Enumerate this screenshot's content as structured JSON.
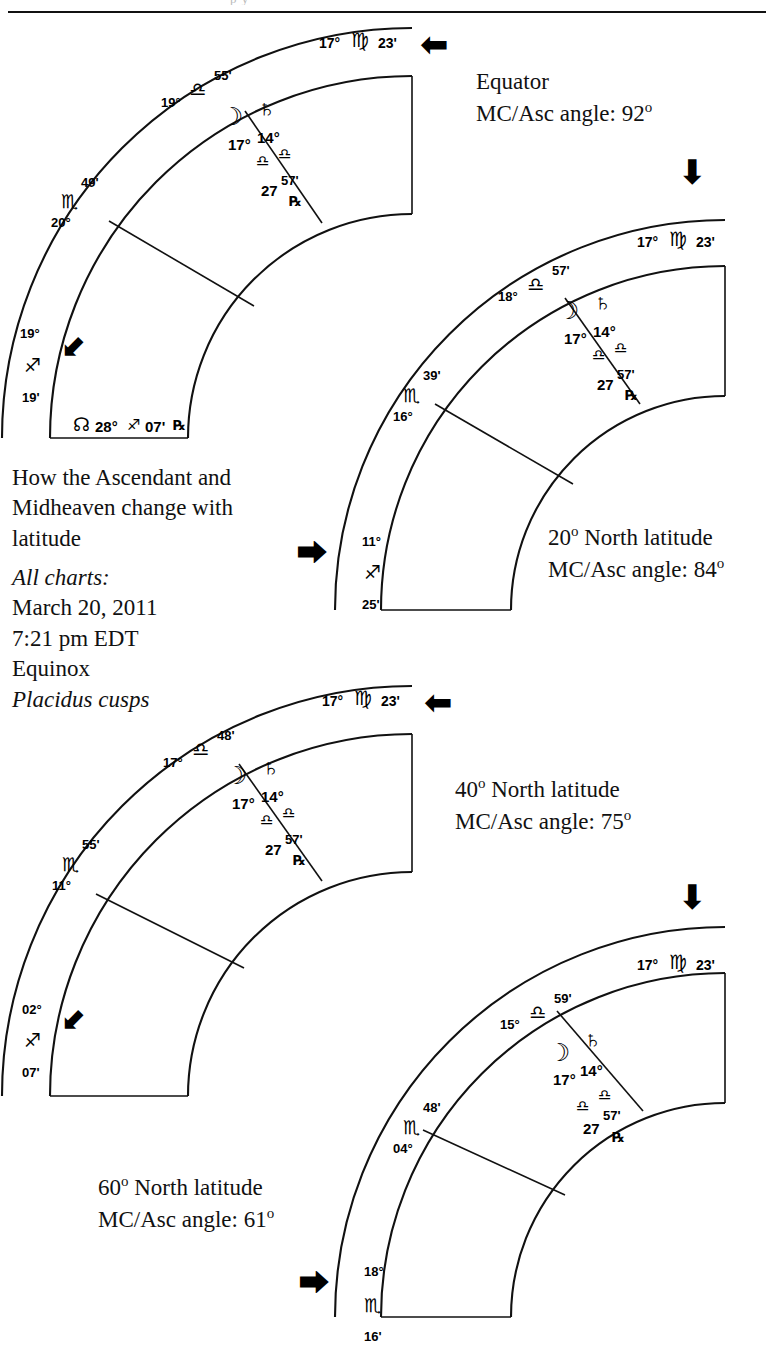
{
  "page": {
    "top_ghost_text": "p                       y"
  },
  "caption": {
    "title_lines": [
      "How the Ascendant and",
      "Midheaven change with",
      "latitude"
    ],
    "all_charts_label": "All charts:",
    "date": "March 20, 2011",
    "time": "7:21 pm EDT",
    "event": "Equinox",
    "house_system": "Placidus cusps"
  },
  "charts": [
    {
      "id": "chart-equator",
      "latitude_label": "Equator",
      "mc_asc_angle_label": "MC/Asc angle: 92",
      "mc_asc_angle_sup": "o",
      "mc": {
        "deg": "17°",
        "sign": "♍",
        "min": "23'"
      },
      "cusps": [
        {
          "name": "cusp-11",
          "deg": "19°",
          "sign": "♎",
          "min": "55'"
        },
        {
          "name": "cusp-12",
          "deg": "20°",
          "sign": "♏",
          "min": "49'"
        },
        {
          "name": "ascendant",
          "deg": "19°",
          "sign": "♐",
          "min": "19'"
        }
      ],
      "planets": [
        {
          "name": "moon",
          "glyph": "☽",
          "deg": "17°",
          "sign": "♎",
          "min": ""
        },
        {
          "name": "saturn",
          "glyph": "♄",
          "deg": "14°",
          "sign": "♎",
          "min": "",
          "retro": ""
        },
        {
          "name": "pluto-or-point",
          "glyph": "",
          "deg": "27",
          "sign": "♎",
          "min": "57'",
          "retro": "℞"
        }
      ],
      "node": {
        "glyph": "☊",
        "deg": "28°",
        "sign": "♐",
        "min": "07'",
        "retro": "℞"
      },
      "mc_arrow": "⬅",
      "asc_arrow": "⬋"
    },
    {
      "id": "chart-20n",
      "latitude_label": "20",
      "latitude_sup": "o",
      "latitude_rest": " North latitude",
      "mc_asc_angle_label": "MC/Asc angle: 84",
      "mc_asc_angle_sup": "o",
      "mc": {
        "deg": "17°",
        "sign": "♍",
        "min": "23'"
      },
      "cusps": [
        {
          "name": "cusp-11",
          "deg": "18°",
          "sign": "♎",
          "min": "57'"
        },
        {
          "name": "cusp-12",
          "deg": "16°",
          "sign": "♏",
          "min": "39'"
        },
        {
          "name": "ascendant",
          "deg": "11°",
          "sign": "♐",
          "min": "25'"
        }
      ],
      "planets": [
        {
          "name": "moon",
          "glyph": "☽",
          "deg": "17°",
          "sign": "♎",
          "min": ""
        },
        {
          "name": "saturn",
          "glyph": "♄",
          "deg": "14°",
          "sign": "♎",
          "min": "",
          "retro": ""
        },
        {
          "name": "pluto-or-point",
          "glyph": "",
          "deg": "27",
          "sign": "♎",
          "min": "57'",
          "retro": "℞"
        }
      ],
      "mc_arrow": "⬇",
      "asc_arrow": "⮕"
    },
    {
      "id": "chart-40n",
      "latitude_label": "40",
      "latitude_sup": "o",
      "latitude_rest": " North latitude",
      "mc_asc_angle_label": "MC/Asc angle: 75",
      "mc_asc_angle_sup": "o",
      "mc": {
        "deg": "17°",
        "sign": "♍",
        "min": "23'"
      },
      "cusps": [
        {
          "name": "cusp-11",
          "deg": "17°",
          "sign": "♎",
          "min": "48'"
        },
        {
          "name": "cusp-12",
          "deg": "11°",
          "sign": "♏",
          "min": "55'"
        },
        {
          "name": "ascendant",
          "deg": "02°",
          "sign": "♐",
          "min": "07'"
        }
      ],
      "planets": [
        {
          "name": "moon",
          "glyph": "☽",
          "deg": "17°",
          "sign": "♎",
          "min": ""
        },
        {
          "name": "saturn",
          "glyph": "♄",
          "deg": "14°",
          "sign": "♎",
          "min": "",
          "retro": ""
        },
        {
          "name": "pluto-or-point",
          "glyph": "",
          "deg": "27",
          "sign": "♎",
          "min": "57'",
          "retro": "℞"
        }
      ],
      "mc_arrow": "⬅",
      "asc_arrow": "⬋"
    },
    {
      "id": "chart-60n",
      "latitude_label": "60",
      "latitude_sup": "o",
      "latitude_rest": " North latitude",
      "mc_asc_angle_label": "MC/Asc angle: 61",
      "mc_asc_angle_sup": "o",
      "mc": {
        "deg": "17°",
        "sign": "♍",
        "min": "23'"
      },
      "cusps": [
        {
          "name": "cusp-11",
          "deg": "15°",
          "sign": "♎",
          "min": "59'"
        },
        {
          "name": "cusp-12",
          "deg": "04°",
          "sign": "♏",
          "min": "48'"
        },
        {
          "name": "ascendant",
          "deg": "18°",
          "sign": "♏",
          "min": "16'"
        }
      ],
      "planets": [
        {
          "name": "moon",
          "glyph": "☽",
          "deg": "17°",
          "sign": "♎",
          "min": ""
        },
        {
          "name": "saturn",
          "glyph": "♄",
          "deg": "14°",
          "sign": "♎",
          "min": "",
          "retro": ""
        },
        {
          "name": "pluto-or-point",
          "glyph": "",
          "deg": "27",
          "sign": "♎",
          "min": "57'",
          "retro": "℞"
        }
      ],
      "mc_arrow": "⬇",
      "asc_arrow": "⮕"
    }
  ],
  "colors": {
    "ink": "#000000",
    "rule": "#111111"
  }
}
